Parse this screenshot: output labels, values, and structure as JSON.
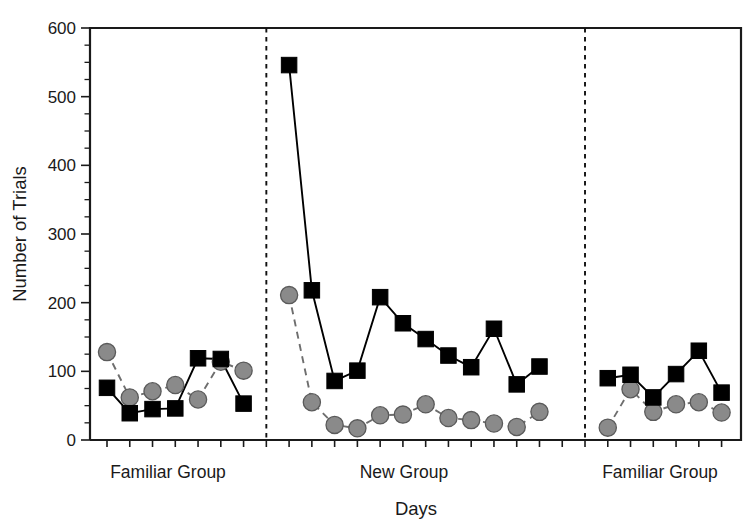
{
  "chart_data": {
    "type": "line",
    "title": "",
    "xlabel": "Days",
    "ylabel": "Number of Trials",
    "ylim": [
      0,
      600
    ],
    "ytick_labels": [
      "0",
      "100",
      "200",
      "300",
      "400",
      "500",
      "600"
    ],
    "ytick_values": [
      0,
      100,
      200,
      300,
      400,
      500,
      600
    ],
    "yminor_step": 25,
    "grid": false,
    "legend_position": "none",
    "xaxis_note": "Consecutive days, unlabeled tick marks; three phases separated by vertical dashed lines",
    "phases": [
      {
        "label": "Familiar Group",
        "start_day": 1,
        "end_day": 7
      },
      {
        "label": "New Group",
        "start_day": 9,
        "end_day": 21
      },
      {
        "label": "Familiar Group",
        "start_day": 23,
        "end_day": 28
      }
    ],
    "series": [
      {
        "name": "squares-black-solid",
        "marker": "square",
        "marker_color": "#000000",
        "line_style": "solid",
        "line_color": "#000000",
        "points": [
          {
            "day": 1,
            "value": 76
          },
          {
            "day": 2,
            "value": 39
          },
          {
            "day": 3,
            "value": 45
          },
          {
            "day": 4,
            "value": 46
          },
          {
            "day": 5,
            "value": 119
          },
          {
            "day": 6,
            "value": 118
          },
          {
            "day": 7,
            "value": 53
          },
          {
            "day": 9,
            "value": 546
          },
          {
            "day": 10,
            "value": 218
          },
          {
            "day": 11,
            "value": 86
          },
          {
            "day": 12,
            "value": 101
          },
          {
            "day": 13,
            "value": 208
          },
          {
            "day": 14,
            "value": 170
          },
          {
            "day": 15,
            "value": 147
          },
          {
            "day": 16,
            "value": 123
          },
          {
            "day": 17,
            "value": 106
          },
          {
            "day": 18,
            "value": 162
          },
          {
            "day": 19,
            "value": 81
          },
          {
            "day": 20,
            "value": 107
          },
          {
            "day": 23,
            "value": 90
          },
          {
            "day": 24,
            "value": 95
          },
          {
            "day": 25,
            "value": 62
          },
          {
            "day": 26,
            "value": 96
          },
          {
            "day": 27,
            "value": 130
          },
          {
            "day": 28,
            "value": 69
          }
        ]
      },
      {
        "name": "circles-gray-dashed",
        "marker": "circle",
        "marker_color": "#8a8a8a",
        "line_style": "dashed",
        "line_color": "#6e6e6e",
        "points": [
          {
            "day": 1,
            "value": 128
          },
          {
            "day": 2,
            "value": 62
          },
          {
            "day": 3,
            "value": 71
          },
          {
            "day": 4,
            "value": 80
          },
          {
            "day": 5,
            "value": 59
          },
          {
            "day": 6,
            "value": 114
          },
          {
            "day": 7,
            "value": 101
          },
          {
            "day": 9,
            "value": 211
          },
          {
            "day": 10,
            "value": 55
          },
          {
            "day": 11,
            "value": 22
          },
          {
            "day": 12,
            "value": 17
          },
          {
            "day": 13,
            "value": 36
          },
          {
            "day": 14,
            "value": 37
          },
          {
            "day": 15,
            "value": 52
          },
          {
            "day": 16,
            "value": 32
          },
          {
            "day": 17,
            "value": 29
          },
          {
            "day": 18,
            "value": 24
          },
          {
            "day": 19,
            "value": 19
          },
          {
            "day": 20,
            "value": 41
          },
          {
            "day": 23,
            "value": 18
          },
          {
            "day": 24,
            "value": 74
          },
          {
            "day": 25,
            "value": 41
          },
          {
            "day": 26,
            "value": 52
          },
          {
            "day": 27,
            "value": 55
          },
          {
            "day": 28,
            "value": 40
          }
        ]
      }
    ]
  },
  "axes": {
    "ylabel": "Number of Trials",
    "xlabel": "Days"
  },
  "group_labels": {
    "left": "Familiar Group",
    "middle": "New Group",
    "right": "Familiar Group"
  },
  "colors": {
    "square_marker": "#000000",
    "circle_marker": "#8a8a8a",
    "axis": "#1a1a1a",
    "divider": "#111111",
    "background": "#ffffff"
  }
}
